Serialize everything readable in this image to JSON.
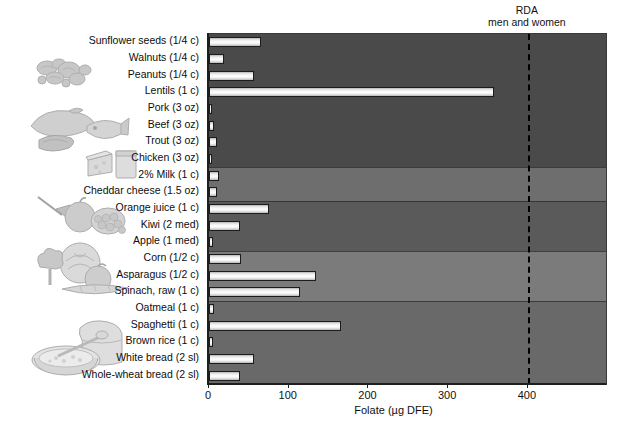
{
  "annotation": {
    "rda_line_1": "RDA",
    "rda_line_2": "men and women",
    "rda_value": 400
  },
  "axis": {
    "x_label": "Folate (µg DFE)",
    "x_ticks": [
      0,
      100,
      200,
      300,
      400
    ],
    "x_min": 0,
    "x_max": 498
  },
  "chart_data": {
    "type": "bar",
    "orientation": "horizontal",
    "title": "",
    "xlabel": "Folate (µg DFE)",
    "ylabel": "",
    "xlim": [
      0,
      498
    ],
    "grid": false,
    "legend": "none",
    "annotations": [
      {
        "text": "RDA men and women",
        "x": 400,
        "style": "vertical dashed line"
      }
    ],
    "categories": [
      "Sunflower seeds (1/4 c)",
      "Walnuts (1/4 c)",
      "Peanuts (1/4 c)",
      "Lentils (1 c)",
      "Pork (3 oz)",
      "Beef (3 oz)",
      "Trout (3 oz)",
      "Chicken (3 oz)",
      "2% Milk (1 c)",
      "Cheddar cheese (1.5 oz)",
      "Orange juice (1 c)",
      "Kiwi (2 med)",
      "Apple (1 med)",
      "Corn (1/2 c)",
      "Asparagus (1/2 c)",
      "Spinach, raw (1 c)",
      "Oatmeal (1 c)",
      "Spaghetti (1 c)",
      "Brown rice (1 c)",
      "White bread (2 sl)",
      "Whole-wheat bread (2 sl)"
    ],
    "values": [
      65,
      19,
      56,
      358,
      4,
      6,
      10,
      4,
      12,
      10,
      75,
      39,
      5,
      40,
      134,
      114,
      6,
      166,
      5,
      57,
      39
    ],
    "group_bands": [
      {
        "name": "nuts-legumes-meats",
        "from": "Sunflower seeds (1/4 c)",
        "to": "Chicken (3 oz)",
        "color": "#4a4a4a"
      },
      {
        "name": "dairy",
        "from": "2% Milk (1 c)",
        "to": "Cheddar cheese (1.5 oz)",
        "color": "#6e6e6e"
      },
      {
        "name": "fruits",
        "from": "Orange juice (1 c)",
        "to": "Apple (1 med)",
        "color": "#5a5a5a"
      },
      {
        "name": "vegetables",
        "from": "Corn (1/2 c)",
        "to": "Spinach, raw (1 c)",
        "color": "#7b7b7b"
      },
      {
        "name": "grains",
        "from": "Oatmeal (1 c)",
        "to": "Whole-wheat bread (2 sl)",
        "color": "#696969"
      }
    ]
  },
  "colors": {
    "bar_fill": "#ffffff",
    "bar_outline": "#1c1c1c",
    "rda_line": "#000000",
    "text": "#111111"
  },
  "artwork": [
    {
      "name": "nuts-illustration"
    },
    {
      "name": "meat-fish-illustration"
    },
    {
      "name": "cheese-milk-illustration"
    },
    {
      "name": "fruit-illustration"
    },
    {
      "name": "vegetables-illustration"
    },
    {
      "name": "bread-cereal-illustration"
    }
  ]
}
